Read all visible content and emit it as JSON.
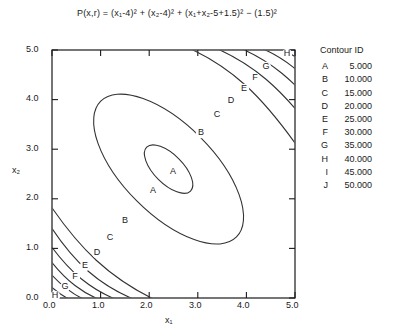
{
  "figure": {
    "title_parts": {
      "lhs": "P(x,r)",
      "equals": "=",
      "term1": "(x₁-4)²",
      "term2": "(x₂-4)²",
      "term3": "(x₁+x₂-5+1.5)²",
      "term4": "(1.5)²"
    },
    "title_plain": "P(x,r) = (x₁-4)² + (x₂-4)² + (x₁+x₂-5+1.5)² - (1.5)²"
  },
  "legend": {
    "title": "Contour ID",
    "rows": [
      {
        "id": "A",
        "value": "5.000"
      },
      {
        "id": "B",
        "value": "10.000"
      },
      {
        "id": "C",
        "value": "15.000"
      },
      {
        "id": "D",
        "value": "20.000"
      },
      {
        "id": "E",
        "value": "25.000"
      },
      {
        "id": "F",
        "value": "30.000"
      },
      {
        "id": "G",
        "value": "35.000"
      },
      {
        "id": "H",
        "value": "40.000"
      },
      {
        "id": "I",
        "value": "45.000"
      },
      {
        "id": "J",
        "value": "50.000"
      }
    ]
  },
  "axes": {
    "xlabel": "x₁",
    "ylabel": "x₂",
    "xticks": [
      "0.0",
      "1.0",
      "2.0",
      "3.0",
      "4.0",
      "5.0"
    ],
    "yticks": [
      "0.0",
      "1.0",
      "2.0",
      "3.0",
      "4.0",
      "5.0"
    ]
  },
  "chart_data": {
    "type": "line",
    "subtype": "contour",
    "xlabel": "x₁",
    "ylabel": "x₂",
    "xlim": [
      0.0,
      5.0
    ],
    "ylim": [
      0.0,
      5.0
    ],
    "xticks": [
      0.0,
      1.0,
      2.0,
      3.0,
      4.0,
      5.0
    ],
    "yticks": [
      0.0,
      1.0,
      2.0,
      3.0,
      4.0,
      5.0
    ],
    "grid": false,
    "legend_position": "right",
    "function": "P(x1,x2) = (x1-4)^2 + (x2-4)^2 + (x1+x2-5+1.5)^2 - (1.5)^2",
    "contour_levels": [
      5.0,
      10.0,
      15.0,
      20.0,
      25.0,
      30.0,
      35.0,
      40.0,
      45.0,
      50.0
    ],
    "contour_ids": [
      "A",
      "B",
      "C",
      "D",
      "E",
      "F",
      "G",
      "H",
      "I",
      "J"
    ],
    "minimum_center": [
      2.4,
      2.6
    ],
    "ellipse_rotation_deg": -45,
    "inline_labels": [
      {
        "id": "A",
        "x": 2.48,
        "y": 2.74
      },
      {
        "id": "A",
        "x": 2.07,
        "y": 2.35
      },
      {
        "id": "B",
        "x": 3.06,
        "y": 3.47
      },
      {
        "id": "B",
        "x": 1.5,
        "y": 1.67
      },
      {
        "id": "C",
        "x": 3.4,
        "y": 3.84
      },
      {
        "id": "C",
        "x": 1.2,
        "y": 1.34
      },
      {
        "id": "D",
        "x": 3.68,
        "y": 4.11
      },
      {
        "id": "D",
        "x": 0.94,
        "y": 1.03
      },
      {
        "id": "E",
        "x": 3.95,
        "y": 4.36
      },
      {
        "id": "E",
        "x": 0.69,
        "y": 0.76
      },
      {
        "id": "F",
        "x": 4.18,
        "y": 4.58
      },
      {
        "id": "F",
        "x": 0.5,
        "y": 0.53
      },
      {
        "id": "G",
        "x": 4.4,
        "y": 4.78
      },
      {
        "id": "G",
        "x": 0.3,
        "y": 0.31
      },
      {
        "id": "H",
        "x": 4.62,
        "y": 4.96
      },
      {
        "id": "H",
        "x": 0.1,
        "y": 0.08
      }
    ]
  }
}
